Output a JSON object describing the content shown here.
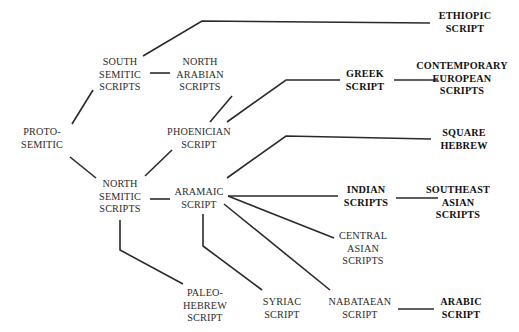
{
  "diagram": {
    "type": "tree-genealogy",
    "background_color": "#ffffff",
    "line_color": "#2a2a2a",
    "text_color": "#2b2b2b",
    "emphasis_color": "#111111",
    "nodes": [
      {
        "id": "proto-semitic",
        "lines": [
          "PROTO-",
          "SEMITIC"
        ],
        "bold": false,
        "x": 14,
        "y": 126,
        "width": 56
      },
      {
        "id": "south-semitic-scripts",
        "lines": [
          "SOUTH",
          "SEMITIC",
          "SCRIPTS"
        ],
        "bold": false,
        "x": 93,
        "y": 56,
        "width": 54
      },
      {
        "id": "north-arabian-scripts",
        "lines": [
          "NORTH",
          "ARABIAN",
          "SCRIPTS"
        ],
        "bold": false,
        "x": 172,
        "y": 56,
        "width": 56
      },
      {
        "id": "ethiopic-script",
        "lines": [
          "ETHIOPIC",
          "SCRIPT"
        ],
        "bold": true,
        "x": 432,
        "y": 10,
        "width": 66
      },
      {
        "id": "north-semitic-scripts",
        "lines": [
          "NORTH",
          "SEMITIC",
          "SCRIPTS"
        ],
        "bold": false,
        "x": 93,
        "y": 178,
        "width": 54
      },
      {
        "id": "phoenician-script",
        "lines": [
          "PHOENICIAN",
          "SCRIPT"
        ],
        "bold": false,
        "x": 163,
        "y": 126,
        "width": 72
      },
      {
        "id": "greek-script",
        "lines": [
          "GREEK",
          "SCRIPT"
        ],
        "bold": true,
        "x": 341,
        "y": 68,
        "width": 48
      },
      {
        "id": "contemporary-european-scripts",
        "lines": [
          "CONTEMPORARY",
          "EUROPEAN",
          "SCRIPTS"
        ],
        "bold": true,
        "x": 412,
        "y": 60,
        "width": 100
      },
      {
        "id": "square-hebrew",
        "lines": [
          "SQUARE",
          "HEBREW"
        ],
        "bold": true,
        "x": 433,
        "y": 127,
        "width": 62
      },
      {
        "id": "aramaic-script",
        "lines": [
          "ARAMAIC",
          "SCRIPT"
        ],
        "bold": false,
        "x": 172,
        "y": 186,
        "width": 54
      },
      {
        "id": "indian-scripts",
        "lines": [
          "INDIAN",
          "SCRIPTS"
        ],
        "bold": true,
        "x": 340,
        "y": 184,
        "width": 52
      },
      {
        "id": "southeast-asian-scripts",
        "lines": [
          "SOUTHEAST",
          "ASIAN",
          "SCRIPTS"
        ],
        "bold": true,
        "x": 423,
        "y": 184,
        "width": 70
      },
      {
        "id": "central-asian-scripts",
        "lines": [
          "CENTRAL",
          "ASIAN",
          "SCRIPTS"
        ],
        "bold": false,
        "x": 335,
        "y": 230,
        "width": 56
      },
      {
        "id": "paleo-hebrew-script",
        "lines": [
          "PALEO-",
          "HEBREW",
          "SCRIPT"
        ],
        "bold": false,
        "x": 180,
        "y": 287,
        "width": 50
      },
      {
        "id": "syriac-script",
        "lines": [
          "SYRIAC",
          "SCRIPT"
        ],
        "bold": false,
        "x": 259,
        "y": 296,
        "width": 46
      },
      {
        "id": "nabataean-script",
        "lines": [
          "NABATAEAN",
          "SCRIPT"
        ],
        "bold": false,
        "x": 327,
        "y": 296,
        "width": 66
      },
      {
        "id": "arabic-script",
        "lines": [
          "ARABIC",
          "SCRIPT"
        ],
        "bold": true,
        "x": 437,
        "y": 296,
        "width": 48
      }
    ],
    "edges": [
      {
        "id": "proto-to-south-semitic",
        "from": "proto-semitic",
        "to": "south-semitic-scripts",
        "points": "72,124 93,90"
      },
      {
        "id": "proto-to-north-semitic",
        "from": "proto-semitic",
        "to": "north-semitic-scripts",
        "points": "70,157 96,178"
      },
      {
        "id": "south-semitic-to-north-arabian",
        "from": "south-semitic-scripts",
        "to": "north-arabian-scripts",
        "points": "150,73 170,73"
      },
      {
        "id": "south-semitic-to-ethiopic",
        "from": "south-semitic-scripts",
        "to": "ethiopic-script",
        "points": "143,56 202,21 430,23"
      },
      {
        "id": "north-arabian-to-phoenician",
        "from": "north-arabian-scripts",
        "to": "phoenician-script",
        "points": "232,96 210,122"
      },
      {
        "id": "north-semitic-to-phoenician",
        "from": "north-semitic-scripts",
        "to": "phoenician-script",
        "points": "145,176 172,150"
      },
      {
        "id": "phoenician-to-greek",
        "from": "phoenician-script",
        "to": "greek-script",
        "points": "227,122 286,80 340,80"
      },
      {
        "id": "north-semitic-to-aramaic",
        "from": "north-semitic-scripts",
        "to": "aramaic-script",
        "points": "150,199 170,199"
      },
      {
        "id": "greek-to-contemporary-european",
        "from": "greek-script",
        "to": "contemporary-european-scripts",
        "points": "394,80 438,80"
      },
      {
        "id": "aramaic-to-square-hebrew",
        "from": "aramaic-script",
        "to": "square-hebrew",
        "points": "227,178 286,136 431,139"
      },
      {
        "id": "aramaic-to-indian",
        "from": "aramaic-script",
        "to": "indian-scripts",
        "points": "228,196 338,196"
      },
      {
        "id": "indian-to-southeast-asian",
        "from": "indian-scripts",
        "to": "southeast-asian-scripts",
        "points": "396,198 438,198"
      },
      {
        "id": "aramaic-to-central-asian",
        "from": "aramaic-script",
        "to": "central-asian-scripts",
        "points": "228,196 334,238"
      },
      {
        "id": "aramaic-to-nabataean",
        "from": "aramaic-script",
        "to": "nabataean-script",
        "points": "224,204 330,290"
      },
      {
        "id": "aramaic-to-syriac",
        "from": "aramaic-script",
        "to": "syriac-script",
        "points": "203,214 203,246 262,290"
      },
      {
        "id": "north-semitic-to-paleo-hebrew",
        "from": "north-semitic-scripts",
        "to": "paleo-hebrew-script",
        "points": "120,220 120,250 183,284"
      },
      {
        "id": "nabataean-to-arabic",
        "from": "nabataean-script",
        "to": "arabic-script",
        "points": "398,309 434,309"
      }
    ]
  }
}
